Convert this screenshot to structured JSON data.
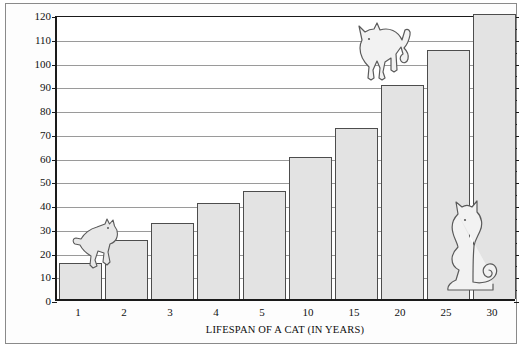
{
  "chart_data": {
    "type": "bar",
    "title": "",
    "xlabel": "LIFESPAN OF A CAT (IN YEARS)",
    "ylabel": "LIFESPAN OF A HUMAN (IN YEARS)",
    "categories": [
      "1",
      "2",
      "3",
      "4",
      "5",
      "10",
      "15",
      "20",
      "25",
      "30"
    ],
    "values": [
      15,
      25,
      32,
      40.5,
      45.5,
      60,
      72,
      90,
      105,
      120
    ],
    "ylim": [
      0,
      120
    ],
    "ytick_labels": [
      "0",
      "10",
      "20",
      "30",
      "40",
      "50",
      "60",
      "70",
      "80",
      "90",
      "100",
      "110",
      "120"
    ],
    "ytick_values": [
      0,
      10,
      20,
      30,
      40,
      50,
      60,
      70,
      80,
      90,
      100,
      110,
      120
    ],
    "grid": "horizontal",
    "legend": "none",
    "bar_fill_color": "#e3e3e3",
    "bar_edge_color": "#4d4d4d",
    "grid_color": "#9a9a9a",
    "axis_color": "#1a1a1a",
    "annotations": [
      {
        "name": "cat-climbing-silhouette",
        "near_category": "1",
        "description": "cat climbing onto first bar"
      },
      {
        "name": "cat-arched-back-silhouette",
        "near_category": "20",
        "description": "cat standing on top of the 20-year bar"
      },
      {
        "name": "cat-sitting-silhouette",
        "near_category": "25",
        "description": "cat sitting in front of the 25-year bar"
      }
    ]
  }
}
